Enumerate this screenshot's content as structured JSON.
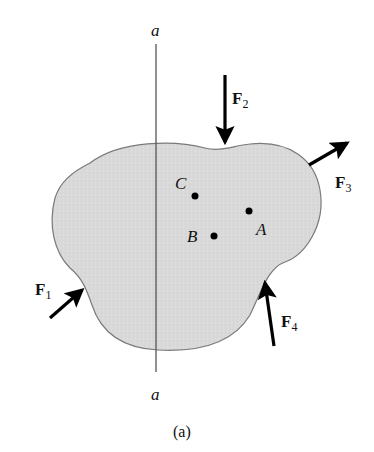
{
  "figure": {
    "caption": "(a)",
    "axis_line": {
      "label_top": "a",
      "label_bottom": "a"
    },
    "body": {
      "fill": "#d9d9d9",
      "stroke": "#7a7a7a"
    },
    "points": [
      {
        "id": "C",
        "label": "C"
      },
      {
        "id": "A",
        "label": "A"
      },
      {
        "id": "B",
        "label": "B"
      }
    ],
    "forces": [
      {
        "id": "F1",
        "symbol": "F",
        "subscript": "1"
      },
      {
        "id": "F2",
        "symbol": "F",
        "subscript": "2"
      },
      {
        "id": "F3",
        "symbol": "F",
        "subscript": "3"
      },
      {
        "id": "F4",
        "symbol": "F",
        "subscript": "4"
      }
    ],
    "colors": {
      "arrow": "#000000",
      "line": "#555555",
      "text": "#111111"
    }
  }
}
